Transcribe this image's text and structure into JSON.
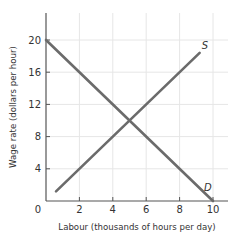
{
  "chart_data": {
    "type": "line",
    "title": "",
    "xlabel": "Labour (thousands of hours per day)",
    "ylabel": "Wage rate (dollars per hour)",
    "xlim": [
      0,
      10.9
    ],
    "ylim": [
      0,
      23.5
    ],
    "x_ticks": [
      0,
      2,
      4,
      6,
      8,
      10
    ],
    "y_ticks": [
      0,
      4,
      8,
      12,
      16,
      20
    ],
    "x_tick_labels": [
      "0",
      "2",
      "4",
      "6",
      "8",
      "10"
    ],
    "y_tick_labels": [
      "4",
      "8",
      "12",
      "16",
      "20"
    ],
    "origin_label": "0",
    "grid": true,
    "legend": false,
    "series": [
      {
        "name": "S",
        "label": "S",
        "points": [
          [
            0.6,
            1.2
          ],
          [
            9.2,
            18.4
          ]
        ],
        "color": "#6b6b6b"
      },
      {
        "name": "D",
        "label": "D",
        "points": [
          [
            0,
            20
          ],
          [
            10,
            0
          ]
        ],
        "color": "#6b6b6b"
      }
    ],
    "equilibrium": {
      "x": 5,
      "y": 10
    }
  },
  "colors": {
    "curve": "#6b6b6b",
    "axis": "#555555",
    "grid": "#e6e6e6",
    "text": "#333333"
  }
}
